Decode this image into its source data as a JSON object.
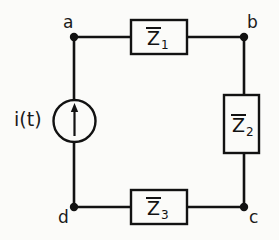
{
  "diagram": {
    "ink_color": "#121212",
    "background_color": "#fbfbf9"
  },
  "nodes": [
    {
      "id": "a",
      "label": "a",
      "x": 74,
      "y": 37
    },
    {
      "id": "b",
      "label": "b",
      "x": 244,
      "y": 37
    },
    {
      "id": "c",
      "label": "c",
      "x": 244,
      "y": 207
    },
    {
      "id": "d",
      "label": "d",
      "x": 74,
      "y": 207
    }
  ],
  "source": {
    "name": "current-source",
    "label": "i(t)",
    "symbol": "arrow-up",
    "center_x": 74,
    "center_y": 121,
    "radius": 21
  },
  "impedances": [
    {
      "id": "Z1",
      "symbol": "Z",
      "overline": true,
      "subscript": "1",
      "orientation": "horizontal",
      "between": [
        "a",
        "b"
      ],
      "box": {
        "x": 131,
        "y": 20,
        "width": 56,
        "height": 34
      }
    },
    {
      "id": "Z2",
      "symbol": "Z",
      "overline": true,
      "subscript": "2",
      "orientation": "vertical",
      "between": [
        "b",
        "c"
      ],
      "box": {
        "x": 224,
        "y": 95,
        "width": 35,
        "height": 58
      }
    },
    {
      "id": "Z3",
      "symbol": "Z",
      "overline": true,
      "subscript": "3",
      "orientation": "horizontal",
      "between": [
        "d",
        "c"
      ],
      "box": {
        "x": 131,
        "y": 190,
        "width": 56,
        "height": 34
      }
    }
  ],
  "wires": [
    {
      "name": "wire-a-to-z1",
      "from": [
        74,
        37
      ],
      "to": [
        131,
        37
      ]
    },
    {
      "name": "wire-z1-to-b",
      "from": [
        187,
        37
      ],
      "to": [
        244,
        37
      ]
    },
    {
      "name": "wire-b-to-z2",
      "from": [
        244,
        37
      ],
      "to": [
        244,
        95
      ]
    },
    {
      "name": "wire-z2-to-c",
      "from": [
        244,
        153
      ],
      "to": [
        244,
        207
      ]
    },
    {
      "name": "wire-c-to-z3",
      "from": [
        244,
        207
      ],
      "to": [
        187,
        207
      ]
    },
    {
      "name": "wire-z3-to-d",
      "from": [
        131,
        207
      ],
      "to": [
        74,
        207
      ]
    },
    {
      "name": "wire-a-to-source",
      "from": [
        74,
        37
      ],
      "to": [
        74,
        100
      ]
    },
    {
      "name": "wire-source-to-d",
      "from": [
        74,
        142
      ],
      "to": [
        74,
        207
      ]
    }
  ]
}
